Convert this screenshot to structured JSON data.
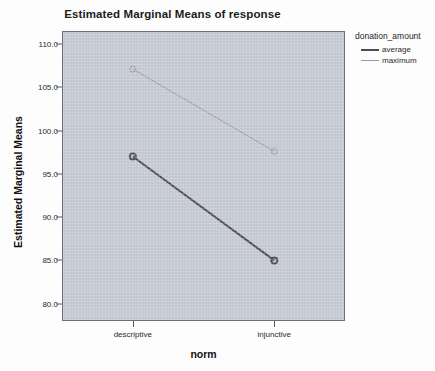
{
  "chart_data": {
    "type": "line",
    "title": "Estimated Marginal Means of response",
    "xlabel": "norm",
    "ylabel": "Estimated Marginal Means",
    "categories": [
      "descriptive",
      "injunctive"
    ],
    "yticks": [
      "110.0",
      "105.0",
      "100.0",
      "95.0",
      "90.0",
      "85.0",
      "80.0"
    ],
    "ytick_values": [
      110.0,
      105.0,
      100.0,
      95.0,
      90.0,
      85.0,
      80.0
    ],
    "ylim": [
      78.0,
      111.5
    ],
    "grid": false,
    "legend_position": "right",
    "legend_title": "donation_amount",
    "series": [
      {
        "name": "average",
        "values": [
          97.0,
          85.0
        ],
        "color": "#4b4b5b",
        "width": 2
      },
      {
        "name": "maximum",
        "values": [
          107.1,
          97.6
        ],
        "color": "#9a9aa8",
        "width": 1
      }
    ]
  },
  "colors": {
    "panel_background": "#c3c7d2",
    "panel_border": "#6b6f7a",
    "page_background": "#fdfdfd",
    "average_series": "#4b4b5b",
    "maximum_series": "#9a9aa8",
    "text": "#1c1c1c"
  }
}
